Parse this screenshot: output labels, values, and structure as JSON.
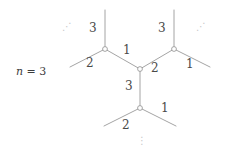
{
  "figure": {
    "caption": {
      "variable": "n",
      "relation": " = ",
      "value": "3",
      "full": "n = 3"
    },
    "stroke_color": "#9a9a9a",
    "vertex_fill": "#ffffff",
    "label_color": "#4a4a4a",
    "ellipsis_color": "#c9c9c9",
    "background": "#ffffff"
  },
  "graph": {
    "description": "trivalent tree fragment with edge labels",
    "vertices": [
      {
        "id": "upper-left",
        "cx": 105,
        "cy": 49,
        "r": 2.4
      },
      {
        "id": "upper-right",
        "cx": 174,
        "cy": 49,
        "r": 2.4
      },
      {
        "id": "center",
        "cx": 140,
        "cy": 69,
        "r": 2.4
      },
      {
        "id": "bottom",
        "cx": 140,
        "cy": 108,
        "r": 2.4
      }
    ],
    "edges": [
      {
        "id": "ul-up",
        "x1": 105,
        "y1": 49,
        "x2": 105,
        "y2": 10,
        "label": "3"
      },
      {
        "id": "ul-downleft",
        "x1": 105,
        "y1": 49,
        "x2": 70,
        "y2": 67,
        "label": "2"
      },
      {
        "id": "ul-center",
        "x1": 105,
        "y1": 49,
        "x2": 140,
        "y2": 69,
        "label": "1"
      },
      {
        "id": "ur-up",
        "x1": 174,
        "y1": 49,
        "x2": 174,
        "y2": 10,
        "label": "3"
      },
      {
        "id": "ur-downright",
        "x1": 174,
        "y1": 49,
        "x2": 210,
        "y2": 67,
        "label": "1"
      },
      {
        "id": "ur-center",
        "x1": 174,
        "y1": 49,
        "x2": 140,
        "y2": 69,
        "label": "2"
      },
      {
        "id": "center-down",
        "x1": 140,
        "y1": 69,
        "x2": 140,
        "y2": 108,
        "label": "3"
      },
      {
        "id": "bot-downleft",
        "x1": 140,
        "y1": 108,
        "x2": 104,
        "y2": 126,
        "label": "2"
      },
      {
        "id": "bot-downright",
        "x1": 140,
        "y1": 108,
        "x2": 176,
        "y2": 126,
        "label": "1"
      }
    ],
    "edge_labels": [
      {
        "id": "label-ul-up",
        "text": "3",
        "x": 89,
        "y": 22
      },
      {
        "id": "label-ul-center",
        "text": "1",
        "x": 123,
        "y": 44
      },
      {
        "id": "label-ul-downleft",
        "text": "2",
        "x": 86,
        "y": 57
      },
      {
        "id": "label-ur-up",
        "text": "3",
        "x": 158,
        "y": 22
      },
      {
        "id": "label-ur-center",
        "text": "2",
        "x": 151,
        "y": 62
      },
      {
        "id": "label-ur-downright",
        "text": "1",
        "x": 186,
        "y": 58
      },
      {
        "id": "label-center-down",
        "text": "3",
        "x": 125,
        "y": 80
      },
      {
        "id": "label-bot-downleft",
        "text": "2",
        "x": 122,
        "y": 119
      },
      {
        "id": "label-bot-downright",
        "text": "1",
        "x": 161,
        "y": 102
      }
    ],
    "ellipses": [
      {
        "id": "ellipsis-upper-left",
        "glyph": "⋰",
        "x": 62,
        "y": 22
      },
      {
        "id": "ellipsis-upper-right",
        "glyph": "⋰",
        "x": 196,
        "y": 22
      },
      {
        "id": "ellipsis-bottom",
        "glyph": "⋮",
        "x": 137,
        "y": 136
      }
    ],
    "caption_position": {
      "x": 16,
      "y": 66
    }
  }
}
